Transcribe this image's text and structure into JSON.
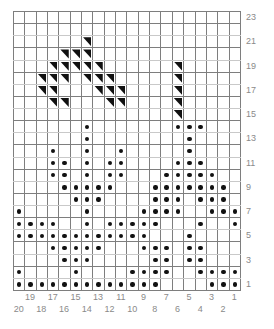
{
  "chart": {
    "title_faint": "",
    "type": "knitting-stitch-chart",
    "columns": 20,
    "rows": 23,
    "colors": {
      "grid_line": "#7e7e7e",
      "grid_line_light": "#c9c9c9",
      "symbol": "#111111",
      "label": "#8a8a8a",
      "background": "#ffffff"
    },
    "legend": {
      "dot_symbol_name": "purl-dot",
      "triangle_symbol_name": "decrease-triangle"
    }
  },
  "axes": {
    "column_labels_odd": [
      "19",
      "17",
      "15",
      "13",
      "11",
      "9",
      "7",
      "5",
      "3",
      "1"
    ],
    "column_labels_even": [
      "20",
      "18",
      "16",
      "14",
      "12",
      "10",
      "8",
      "6",
      "4",
      "2"
    ],
    "row_labels": [
      "23",
      "21",
      "19",
      "17",
      "15",
      "13",
      "11",
      "9",
      "7",
      "5",
      "3",
      "1"
    ]
  },
  "chart_data": {
    "type": "heatmap",
    "xlabel": "",
    "ylabel": "",
    "grid": true,
    "legend_position": "none",
    "columns": 20,
    "rows": 23,
    "x_tick_labels": [
      "20",
      "19",
      "18",
      "17",
      "16",
      "15",
      "14",
      "13",
      "12",
      "11",
      "10",
      "9",
      "8",
      "7",
      "6",
      "5",
      "4",
      "3",
      "2",
      "1"
    ],
    "y_tick_labels": [
      "23",
      "22",
      "21",
      "20",
      "19",
      "18",
      "17",
      "16",
      "15",
      "14",
      "13",
      "12",
      "11",
      "10",
      "9",
      "8",
      "7",
      "6",
      "5",
      "4",
      "3",
      "2",
      "1"
    ],
    "symbols": {
      "0": "blank",
      "1": "dot",
      "2": "triangle"
    },
    "cells": [
      [
        0,
        0,
        0,
        0,
        0,
        0,
        0,
        0,
        0,
        0,
        0,
        0,
        0,
        0,
        0,
        0,
        0,
        0,
        0,
        0
      ],
      [
        0,
        0,
        0,
        0,
        0,
        0,
        0,
        0,
        0,
        0,
        0,
        0,
        0,
        0,
        0,
        0,
        0,
        0,
        0,
        0
      ],
      [
        0,
        0,
        0,
        0,
        0,
        0,
        2,
        0,
        0,
        0,
        0,
        0,
        0,
        0,
        0,
        0,
        0,
        0,
        0,
        0
      ],
      [
        0,
        0,
        0,
        0,
        2,
        2,
        2,
        0,
        0,
        0,
        0,
        0,
        0,
        0,
        0,
        0,
        0,
        0,
        0,
        0
      ],
      [
        0,
        0,
        0,
        2,
        2,
        2,
        2,
        2,
        0,
        0,
        0,
        0,
        0,
        0,
        2,
        0,
        0,
        0,
        0,
        0
      ],
      [
        0,
        0,
        2,
        2,
        2,
        0,
        2,
        2,
        2,
        0,
        0,
        0,
        0,
        0,
        2,
        0,
        0,
        0,
        0,
        0
      ],
      [
        0,
        0,
        2,
        2,
        0,
        0,
        0,
        2,
        2,
        2,
        0,
        0,
        0,
        0,
        2,
        0,
        0,
        0,
        0,
        0
      ],
      [
        0,
        0,
        0,
        2,
        2,
        0,
        0,
        0,
        2,
        2,
        0,
        0,
        0,
        0,
        2,
        0,
        0,
        0,
        0,
        0
      ],
      [
        0,
        0,
        0,
        0,
        0,
        0,
        0,
        0,
        0,
        0,
        0,
        0,
        0,
        0,
        2,
        0,
        0,
        0,
        0,
        0
      ],
      [
        0,
        0,
        0,
        0,
        0,
        0,
        1,
        0,
        0,
        0,
        0,
        0,
        0,
        0,
        1,
        1,
        1,
        0,
        0,
        0
      ],
      [
        0,
        0,
        0,
        0,
        0,
        0,
        1,
        0,
        0,
        0,
        0,
        0,
        0,
        0,
        0,
        1,
        0,
        0,
        0,
        0
      ],
      [
        0,
        0,
        0,
        1,
        0,
        0,
        1,
        0,
        0,
        1,
        0,
        0,
        0,
        0,
        0,
        1,
        0,
        0,
        0,
        0
      ],
      [
        0,
        0,
        0,
        1,
        1,
        0,
        1,
        0,
        1,
        1,
        0,
        0,
        0,
        0,
        1,
        1,
        1,
        0,
        0,
        0
      ],
      [
        0,
        0,
        0,
        1,
        1,
        0,
        1,
        0,
        1,
        1,
        0,
        0,
        0,
        1,
        1,
        1,
        1,
        1,
        0,
        0
      ],
      [
        0,
        0,
        0,
        0,
        1,
        1,
        1,
        1,
        1,
        0,
        0,
        0,
        1,
        1,
        1,
        1,
        1,
        1,
        1,
        0
      ],
      [
        0,
        0,
        0,
        0,
        0,
        1,
        1,
        1,
        0,
        0,
        0,
        0,
        1,
        1,
        1,
        0,
        1,
        1,
        1,
        0
      ],
      [
        1,
        0,
        0,
        0,
        0,
        0,
        1,
        0,
        0,
        0,
        0,
        1,
        1,
        1,
        1,
        0,
        0,
        1,
        1,
        1
      ],
      [
        1,
        1,
        1,
        1,
        0,
        0,
        1,
        0,
        1,
        1,
        1,
        1,
        1,
        0,
        0,
        0,
        1,
        0,
        0,
        1
      ],
      [
        1,
        1,
        1,
        1,
        1,
        1,
        1,
        1,
        1,
        1,
        1,
        1,
        0,
        0,
        0,
        1,
        0,
        0,
        0,
        0
      ],
      [
        0,
        0,
        0,
        1,
        1,
        1,
        1,
        1,
        0,
        0,
        0,
        1,
        1,
        1,
        0,
        1,
        1,
        0,
        0,
        0
      ],
      [
        0,
        0,
        0,
        0,
        1,
        1,
        1,
        0,
        0,
        0,
        0,
        0,
        1,
        1,
        0,
        1,
        1,
        0,
        0,
        0
      ],
      [
        1,
        0,
        0,
        0,
        0,
        1,
        0,
        0,
        0,
        0,
        1,
        1,
        1,
        1,
        0,
        0,
        1,
        1,
        1,
        1
      ],
      [
        1,
        1,
        1,
        1,
        1,
        1,
        1,
        1,
        1,
        1,
        1,
        1,
        1,
        0,
        0,
        0,
        0,
        1,
        1,
        1
      ]
    ]
  }
}
